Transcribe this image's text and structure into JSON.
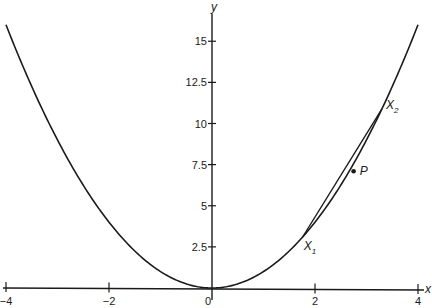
{
  "chart_data": {
    "type": "line",
    "title": "",
    "xlabel": "x",
    "ylabel": "y",
    "xlim": [
      -4.1,
      4.1
    ],
    "ylim": [
      -0.2,
      16.9
    ],
    "grid": false,
    "x_ticks": [
      -4,
      -2,
      0,
      2,
      4
    ],
    "x_tick_labels": [
      "-4",
      "-2",
      "0",
      "2",
      "4"
    ],
    "y_ticks": [
      2.5,
      5,
      7.5,
      10,
      12.5,
      15
    ],
    "y_tick_labels": [
      "2.5",
      "5",
      "7.5",
      "10",
      "12.5",
      "15"
    ],
    "series": [
      {
        "name": "y = x^2",
        "function": "x^2",
        "x_range": [
          -4,
          4
        ]
      },
      {
        "name": "chord X1X2",
        "x": [
          1.76,
          3.3
        ],
        "y": [
          3.1,
          10.89
        ]
      }
    ],
    "annotations": [
      {
        "label": "X",
        "subscript": "1",
        "x": 1.76,
        "y": 3.1
      },
      {
        "label": "X",
        "subscript": "2",
        "x": 3.3,
        "y": 10.89
      },
      {
        "label": "P",
        "x": 2.75,
        "y": 7.1,
        "marker": "dot"
      }
    ]
  }
}
